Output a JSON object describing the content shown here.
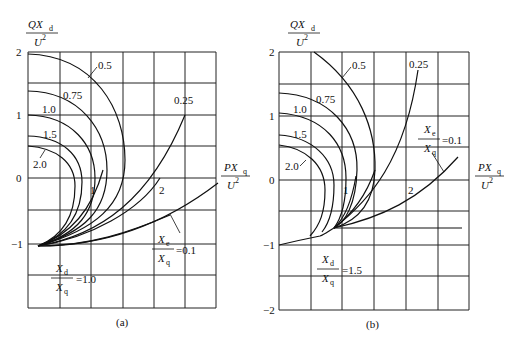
{
  "figure": {
    "panels": [
      {
        "id": "a",
        "caption": "(a)",
        "y_axis_label": {
          "num": "QX",
          "num_sub": "d",
          "den": "U",
          "den_sup": "2"
        },
        "x_axis_label": {
          "num": "PX",
          "num_sub": "q",
          "den": "U",
          "den_sup": "2"
        },
        "y_ticks": [
          "2",
          "1",
          "0",
          "−1"
        ],
        "ratio_label": {
          "num": "X",
          "num_sub": "d",
          "den": "X",
          "den_sub": "q",
          "value": "=1.0"
        },
        "xe_label": {
          "num": "X",
          "num_sub": "e",
          "den": "X",
          "den_sub": "q",
          "value": "=0.1"
        },
        "curve_labels": [
          "0.5",
          "0.75",
          "1.0",
          "1.5",
          "2.0",
          "1",
          "2",
          "0.25"
        ]
      },
      {
        "id": "b",
        "caption": "(b)",
        "y_axis_label": {
          "num": "QX",
          "num_sub": "d",
          "den": "U",
          "den_sup": "2"
        },
        "x_axis_label": {
          "num": "PX",
          "num_sub": "q",
          "den": "U",
          "den_sup": "2"
        },
        "y_ticks": [
          "2",
          "1",
          "0",
          "−1",
          "−2"
        ],
        "ratio_label": {
          "num": "X",
          "num_sub": "d",
          "den": "X",
          "den_sub": "q",
          "value": "=1.5"
        },
        "xe_label": {
          "num": "X",
          "num_sub": "e",
          "den": "X",
          "den_sub": "q",
          "value": "=0.1"
        },
        "curve_labels": [
          "0.5",
          "0.75",
          "1.0",
          "1.5",
          "2.0",
          "1",
          "2",
          "0.25"
        ]
      }
    ]
  }
}
